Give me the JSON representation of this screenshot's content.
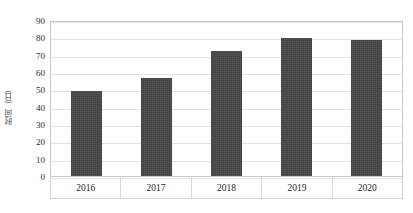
{
  "chart_data": {
    "type": "bar",
    "title": "",
    "xlabel": "",
    "ylabel": "时间（日）",
    "categories": [
      "2016",
      "2017",
      "2018",
      "2019",
      "2020"
    ],
    "values": [
      49,
      56.5,
      72,
      79.5,
      78.5
    ],
    "series": [
      {
        "name": "时间（日）",
        "values": [
          49,
          56.5,
          72,
          79.5,
          78.5
        ]
      }
    ],
    "ylim": [
      0,
      90
    ],
    "yticks": [
      0,
      10,
      20,
      30,
      40,
      50,
      60,
      70,
      80,
      90
    ],
    "ytick_labels": [
      "0",
      "10",
      "20",
      "30",
      "40",
      "50",
      "60",
      "70",
      "80",
      "90"
    ],
    "grid": true,
    "grid_axis": "y",
    "legend": false,
    "legend_position": "none",
    "bar_color": "#454545",
    "grid_color": "#e2e2e2",
    "axis_border_color": "#c9c9c9",
    "background": "#ffffff"
  }
}
